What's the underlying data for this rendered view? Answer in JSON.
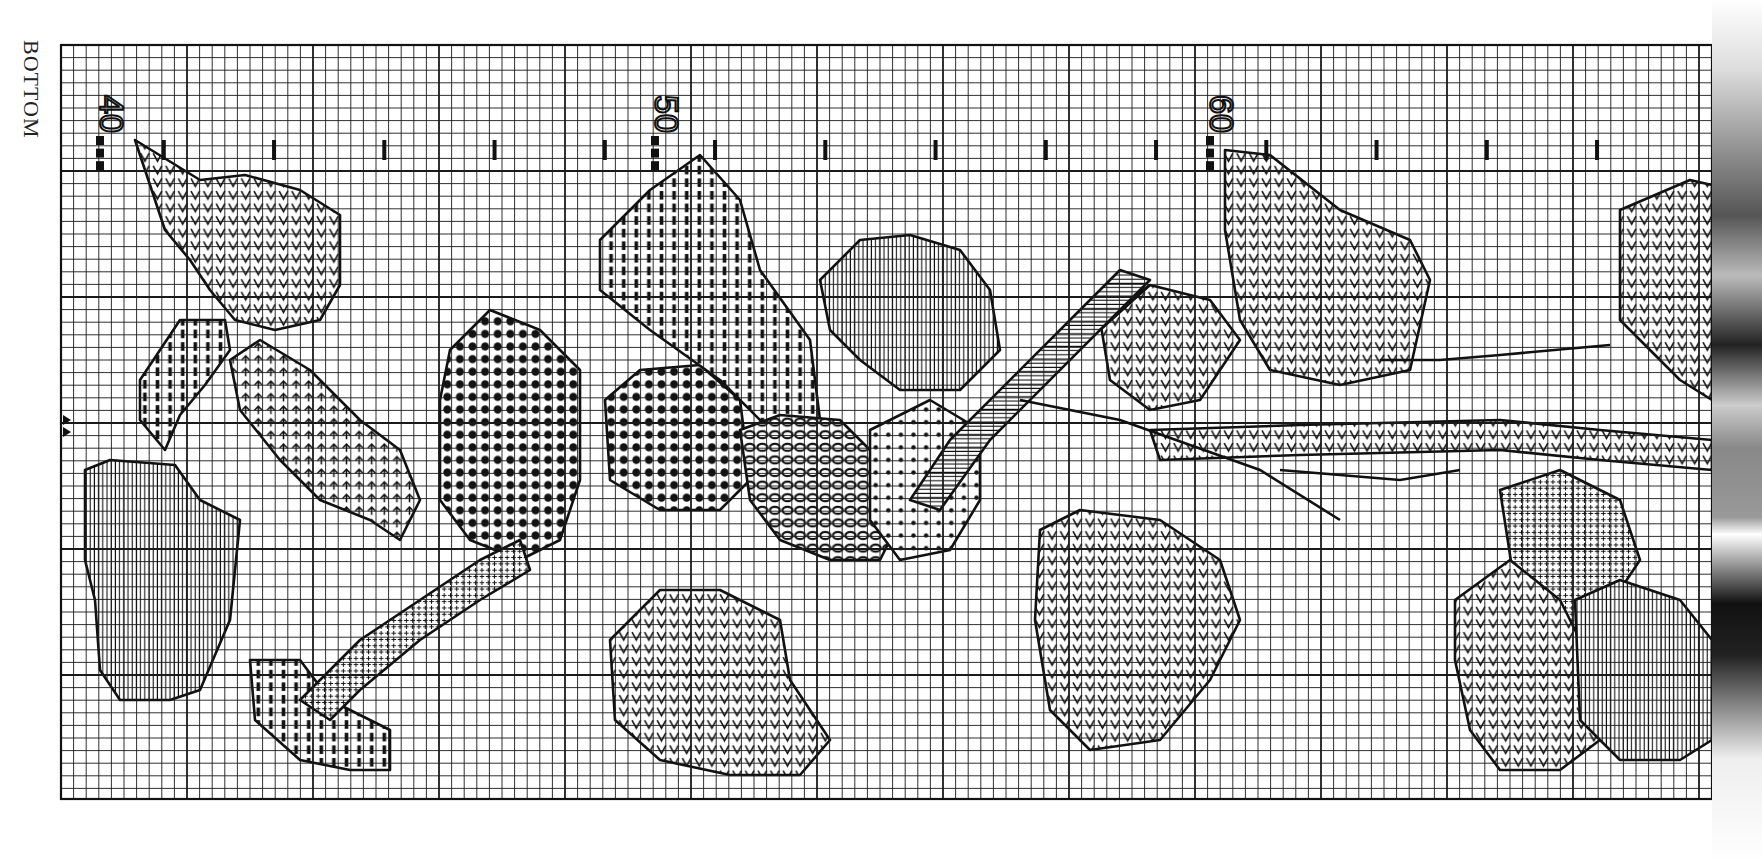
{
  "page": {
    "side_label": "BOTTOM",
    "column_numbers": [
      {
        "label": "40",
        "x": 100
      },
      {
        "label": "50",
        "x": 655
      },
      {
        "label": "60",
        "x": 1210
      }
    ],
    "center_markers": [
      "triangle-right",
      "triangle-right"
    ]
  },
  "grid": {
    "left": 61,
    "top": 45,
    "right": 1712,
    "bottom": 799,
    "cell": 12.6,
    "major_every": 10,
    "line_color": "#1a1a1a",
    "paper_color": "#ffffff"
  },
  "legend_symbols": [
    {
      "id": "zigzag",
      "name": "V / zigzag stitch"
    },
    {
      "id": "vlines",
      "name": "vertical lines"
    },
    {
      "id": "bars",
      "name": "solid bars"
    },
    {
      "id": "cross",
      "name": "plus cross"
    },
    {
      "id": "dots",
      "name": "filled circles"
    },
    {
      "id": "rings",
      "name": "open circles"
    },
    {
      "id": "arrow",
      "name": "up arrows"
    },
    {
      "id": "slash",
      "name": "diagonal slash"
    },
    {
      "id": "centerdot",
      "name": "center dot"
    },
    {
      "id": "hlines",
      "name": "horizontal lines"
    }
  ],
  "motifs": [
    {
      "name": "leaf-top-left",
      "fill": "zigzag",
      "points": "135,140 200,180 245,175 300,190 340,215 340,285 320,320 275,330 235,320 210,290 190,260 165,230"
    },
    {
      "name": "leaf-left-bottom",
      "fill": "vlines",
      "points": "85,470 110,460 175,465 200,500 240,520 230,620 200,690 170,700 120,700 100,670 95,600 85,560"
    },
    {
      "name": "stem-left-bars",
      "fill": "bars",
      "points": "140,380 180,320 225,320 230,350 205,385 180,415 165,450 140,420"
    },
    {
      "name": "stem-arrows",
      "fill": "arrow",
      "points": "230,360 260,340 310,370 360,420 400,450 420,500 400,540 370,520 320,500 280,460 240,410"
    },
    {
      "name": "flower-dots-left",
      "fill": "dots",
      "points": "450,350 490,310 540,330 580,370 580,480 560,540 520,560 470,540 440,500 440,400"
    },
    {
      "name": "flower-dots-center",
      "fill": "dots",
      "points": "605,400 640,370 700,365 740,400 750,480 720,510 660,510 610,480"
    },
    {
      "name": "leaf-top-center",
      "fill": "bars",
      "points": "600,240 650,190 700,155 740,200 760,270 810,340 820,420 780,440 720,380 650,330 600,290"
    },
    {
      "name": "leaf-top-center-right",
      "fill": "vlines",
      "points": "820,280 860,240 910,235 960,250 990,290 1000,350 960,390 900,390 860,360 830,330"
    },
    {
      "name": "flower-rings",
      "fill": "rings",
      "points": "740,430 780,415 840,420 880,460 900,520 880,560 830,560 780,540 750,500"
    },
    {
      "name": "flower-centerdot",
      "fill": "centerdot",
      "points": "870,430 930,400 980,430 980,500 950,550 900,560 870,520"
    },
    {
      "name": "leaf-bottom-center",
      "fill": "zigzag",
      "points": "610,640 660,590 720,590 780,620 790,680 830,740 800,775 730,775 660,760 615,720"
    },
    {
      "name": "leaf-bottom-center-right",
      "fill": "zigzag",
      "points": "1040,530 1080,510 1160,520 1220,560 1240,620 1210,680 1160,740 1090,750 1050,710 1035,620"
    },
    {
      "name": "leaf-diagonal",
      "fill": "zigzag",
      "points": "1100,320 1150,285 1210,300 1240,340 1200,400 1150,410 1110,380"
    },
    {
      "name": "stem-diagonal-hlines",
      "fill": "hlines",
      "points": "1090,300 1120,270 1150,280 990,440 940,510 910,500 950,440"
    },
    {
      "name": "leaf-top-right",
      "fill": "zigzag",
      "points": "1225,150 1270,155 1340,210 1410,240 1430,280 1410,370 1340,385 1270,370 1240,320 1225,230"
    },
    {
      "name": "leaf-top-right-edge",
      "fill": "zigzag",
      "points": "1620,210 1690,180 1712,185 1712,400 1680,380 1620,320"
    },
    {
      "name": "stem-horizontal-right",
      "fill": "zigzag",
      "points": "1150,430 1300,425 1500,420 1600,430 1712,440 1712,470 1600,460 1500,450 1300,455 1160,460"
    },
    {
      "name": "leaf-bottom-right-1",
      "fill": "cross",
      "points": "1500,490 1560,470 1620,500 1640,560 1600,620 1560,640 1520,620"
    },
    {
      "name": "leaf-bottom-right-2",
      "fill": "zigzag",
      "points": "1455,600 1510,560 1560,600 1590,660 1600,740 1560,770 1500,770 1470,730 1455,660"
    },
    {
      "name": "leaf-bottom-right-3",
      "fill": "vlines",
      "points": "1575,600 1620,580 1680,600 1712,640 1712,740 1680,760 1620,760 1580,720"
    },
    {
      "name": "stem-bottom-left-bars",
      "fill": "bars",
      "points": "250,660 300,660 330,700 370,720 390,730 390,770 350,770 300,760 255,720"
    },
    {
      "name": "stem-lower-cross",
      "fill": "cross",
      "points": "300,700 360,640 420,600 480,560 520,540 530,570 480,600 420,640 360,690 330,720"
    }
  ],
  "outline_paths": [
    "M 1150 285 L 1100 330",
    "M 1380 360 L 1440 360 L 1500 355 L 1610 345",
    "M 1020 400 L 1120 420 L 1260 470 L 1340 520",
    "M 1280 470 L 1400 480 L 1460 470"
  ]
}
